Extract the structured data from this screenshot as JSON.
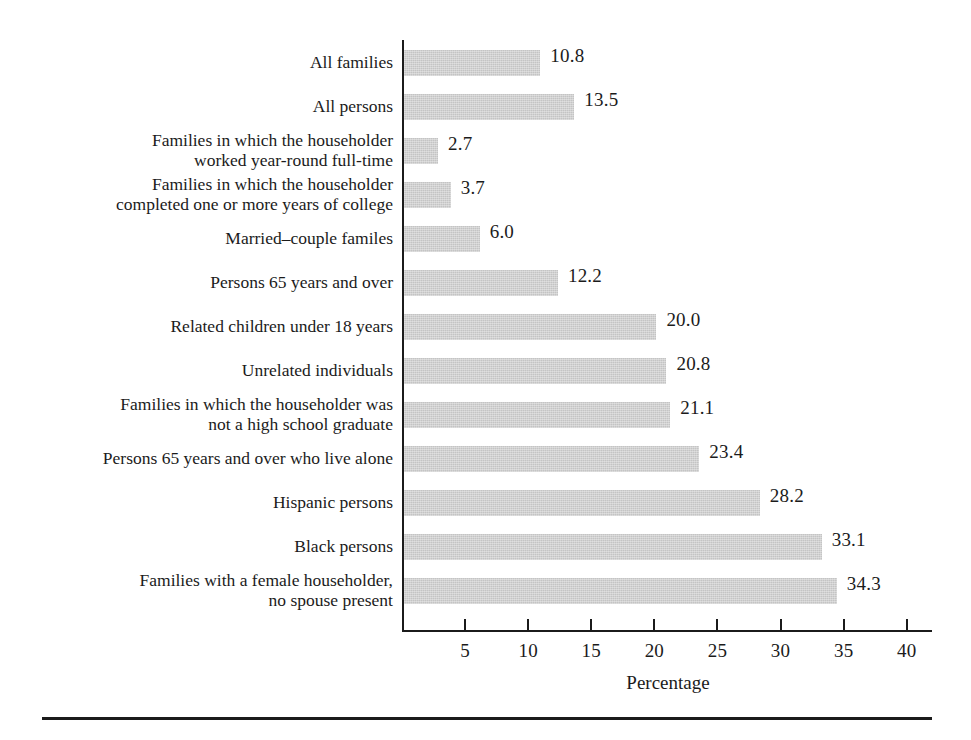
{
  "chart_data": {
    "type": "bar",
    "orientation": "horizontal",
    "title": "",
    "subtitle": "",
    "xlabel": "Percentage",
    "ylabel": "",
    "xlim": [
      0,
      42
    ],
    "grid": false,
    "legend": null,
    "xticks": [
      5,
      10,
      15,
      20,
      25,
      30,
      35,
      40
    ],
    "xtick_labels": [
      "5",
      "10",
      "15",
      "20",
      "25",
      "30",
      "35",
      "40"
    ],
    "categories": [
      "All families",
      "All persons",
      "Families in which the householder\nworked year-round full-time",
      "Families in which the householder\ncompleted one or more years of college",
      "Married–couple familes",
      "Persons 65 years and over",
      "Related children under 18 years",
      "Unrelated individuals",
      "Families in which the householder was\nnot a high school graduate",
      "Persons 65 years and over who live alone",
      "Hispanic persons",
      "Black persons",
      "Families with a female householder,\nno spouse present"
    ],
    "values": [
      10.8,
      13.5,
      2.7,
      3.7,
      6.0,
      12.2,
      20.0,
      20.8,
      21.1,
      23.4,
      28.2,
      33.1,
      34.3
    ],
    "value_labels": [
      "10.8",
      "13.5",
      "2.7",
      "3.7",
      "6.0",
      "12.2",
      "20.0",
      "20.8",
      "21.1",
      "23.4",
      "28.2",
      "33.1",
      "34.3"
    ],
    "bar_color": "#c4c4c4",
    "axis_color": "#1b1b1b",
    "text_color": "#1b1b1b",
    "background_color": "#ffffff"
  }
}
